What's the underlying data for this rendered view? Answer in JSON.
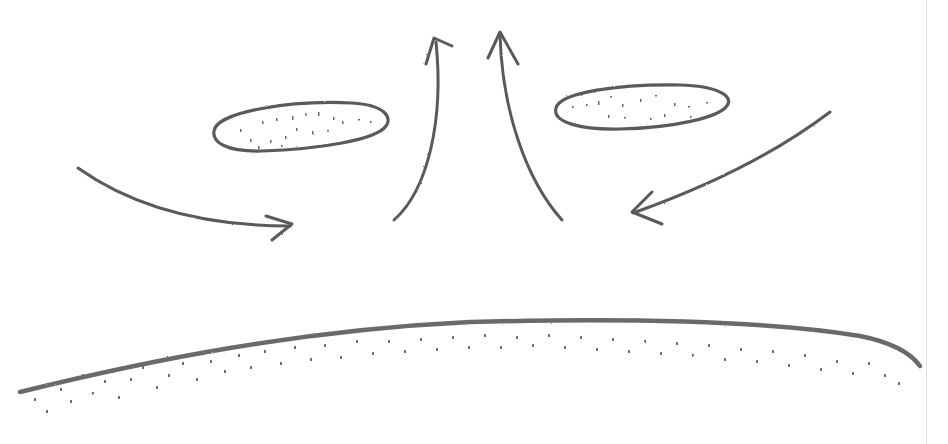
{
  "diagram": {
    "style": "pencil sketch",
    "colors": {
      "stroke": "#5a5a5a",
      "stipple": "#6a6a6a",
      "paper": "#ffffff",
      "edge": "#e2e2e2"
    },
    "elements": {
      "clouds": [
        {
          "id": "cloud-left",
          "cx": 300,
          "cy": 127,
          "rx": 88,
          "ry": 24
        },
        {
          "id": "cloud-right",
          "cx": 642,
          "cy": 106,
          "rx": 87,
          "ry": 23
        }
      ],
      "arrows": [
        {
          "id": "inflow-left",
          "direction": "right",
          "from": [
            78,
            168
          ],
          "to": [
            290,
            228
          ]
        },
        {
          "id": "updraft-left",
          "direction": "up",
          "from": [
            394,
            220
          ],
          "to": [
            436,
            38
          ]
        },
        {
          "id": "updraft-right",
          "direction": "up",
          "from": [
            562,
            220
          ],
          "to": [
            500,
            32
          ]
        },
        {
          "id": "inflow-right",
          "direction": "left",
          "from": [
            830,
            112
          ],
          "to": [
            634,
            212
          ]
        }
      ],
      "ground": {
        "id": "ground-surface",
        "top_y": 322,
        "left": [
          20,
          392
        ],
        "right": [
          920,
          366
        ]
      }
    }
  }
}
